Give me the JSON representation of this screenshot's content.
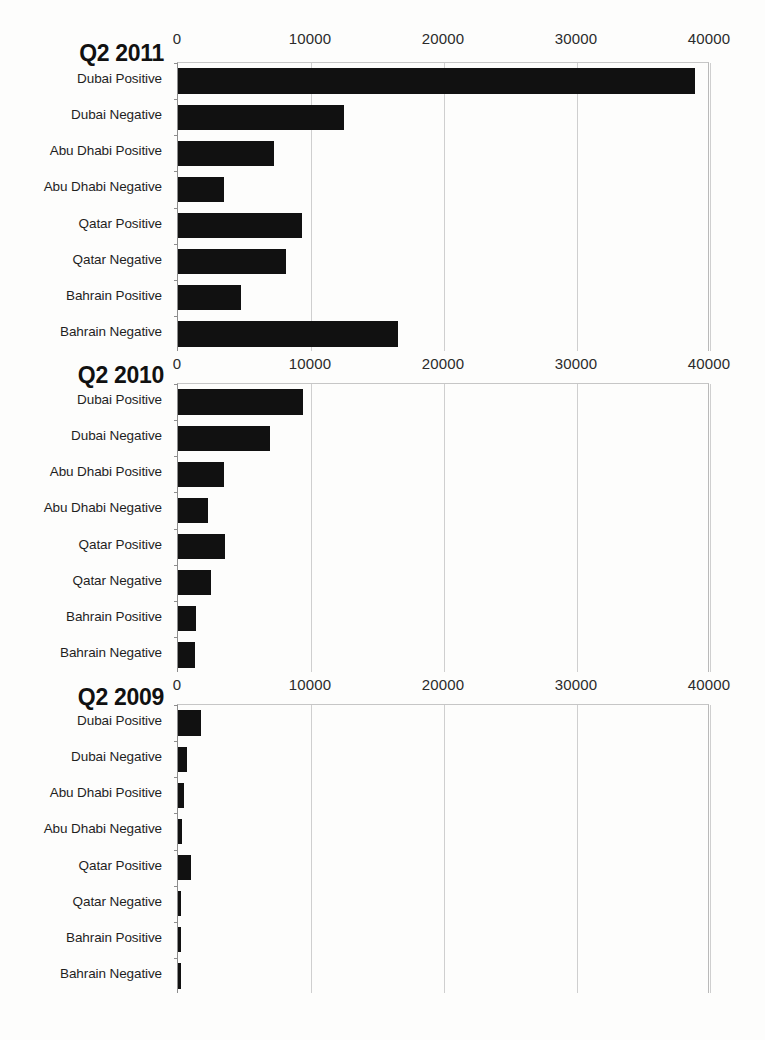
{
  "chart_data": [
    {
      "type": "bar",
      "orientation": "horizontal",
      "title": "Q2 2011",
      "xlabel": "",
      "ylabel": "",
      "xlim": [
        0,
        40000
      ],
      "xticks": [
        0,
        10000,
        20000,
        30000,
        40000
      ],
      "xtick_labels": [
        "0",
        "10000",
        "20000",
        "30000",
        "40000"
      ],
      "grid": true,
      "legend": "none",
      "bar_color": "#111111",
      "categories": [
        "Dubai Positive",
        "Dubai Negative",
        "Abu Dhabi Positive",
        "Abu Dhabi Negative",
        "Qatar Positive",
        "Qatar Negative",
        "Bahrain Positive",
        "Bahrain Negative"
      ],
      "values": [
        38900,
        12450,
        7200,
        3480,
        9320,
        8120,
        4740,
        16520
      ]
    },
    {
      "type": "bar",
      "orientation": "horizontal",
      "title": "Q2 2010",
      "xlabel": "",
      "ylabel": "",
      "xlim": [
        0,
        40000
      ],
      "xticks": [
        0,
        10000,
        20000,
        30000,
        40000
      ],
      "xtick_labels": [
        "0",
        "10000",
        "20000",
        "30000",
        "40000"
      ],
      "grid": true,
      "legend": "none",
      "bar_color": "#111111",
      "categories": [
        "Dubai Positive",
        "Dubai Negative",
        "Abu Dhabi Positive",
        "Abu Dhabi Negative",
        "Qatar Positive",
        "Qatar Negative",
        "Bahrain Positive",
        "Bahrain Negative"
      ],
      "values": [
        9380,
        6940,
        3440,
        2280,
        3530,
        2480,
        1350,
        1280
      ]
    },
    {
      "type": "bar",
      "orientation": "horizontal",
      "title": "Q2 2009",
      "xlabel": "",
      "ylabel": "",
      "xlim": [
        0,
        40000
      ],
      "xticks": [
        0,
        10000,
        20000,
        30000,
        40000
      ],
      "xtick_labels": [
        "0",
        "10000",
        "20000",
        "30000",
        "40000"
      ],
      "grid": true,
      "legend": "none",
      "bar_color": "#111111",
      "categories": [
        "Dubai Positive",
        "Dubai Negative",
        "Abu Dhabi Positive",
        "Abu Dhabi Negative",
        "Qatar Positive",
        "Qatar Negative",
        "Bahrain Positive",
        "Bahrain Negative"
      ],
      "values": [
        1700,
        700,
        450,
        300,
        1000,
        250,
        200,
        200
      ]
    }
  ],
  "layout": {
    "panels": [
      {
        "top": 30,
        "plot_top": 62,
        "plot_height": 289
      },
      {
        "top": 355,
        "plot_top": 383,
        "plot_height": 289
      },
      {
        "top": 676,
        "plot_top": 704,
        "plot_height": 289
      }
    ],
    "title_tops": [
      40,
      362,
      684
    ],
    "plot_left": 177,
    "plot_width": 532
  }
}
